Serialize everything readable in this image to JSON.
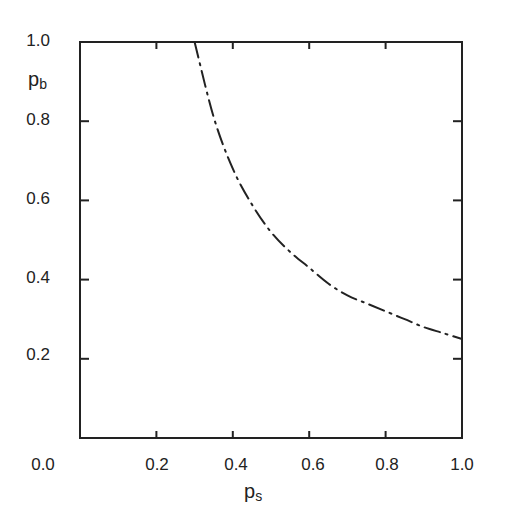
{
  "chart_data": {
    "type": "line",
    "title": "",
    "xlabel": "p_s",
    "ylabel": "p_b",
    "xlabel_main": "p",
    "xlabel_sub": "s",
    "ylabel_main": "p",
    "ylabel_sub": "b",
    "xlim": [
      0.0,
      1.0
    ],
    "ylim": [
      0.0,
      1.0
    ],
    "grid": false,
    "legend": null,
    "x_ticks": [
      "0.0",
      "0.2",
      "0.4",
      "0.6",
      "0.8",
      "1.0"
    ],
    "y_ticks": [
      "0.2",
      "0.4",
      "0.6",
      "0.8",
      "1.0"
    ],
    "series": [
      {
        "name": "boundary curve",
        "style": "dash-dot",
        "x": [
          0.3,
          0.35,
          0.4,
          0.45,
          0.5,
          0.55,
          0.6,
          0.65,
          0.7,
          0.75,
          0.8,
          0.85,
          0.9,
          0.95,
          1.0
        ],
        "y": [
          1.0,
          0.81,
          0.68,
          0.59,
          0.52,
          0.47,
          0.43,
          0.39,
          0.36,
          0.34,
          0.32,
          0.3,
          0.28,
          0.265,
          0.25
        ]
      }
    ]
  }
}
